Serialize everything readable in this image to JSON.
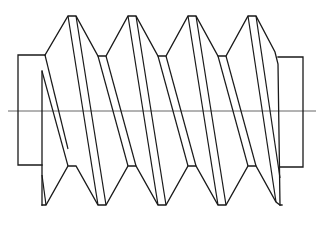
{
  "figure": {
    "colors": {
      "stroke": "#1a1a1a",
      "centerline": "#555555",
      "background": "#ffffff"
    },
    "centerline": {
      "x1": 8,
      "y": 111,
      "x2": 316
    },
    "left_shaft": {
      "x": 18,
      "y": 55,
      "width": 27,
      "height": 110
    },
    "right_shaft": {
      "x": 278,
      "y": 57,
      "width": 25,
      "height": 110
    },
    "thread_count": 4
  }
}
